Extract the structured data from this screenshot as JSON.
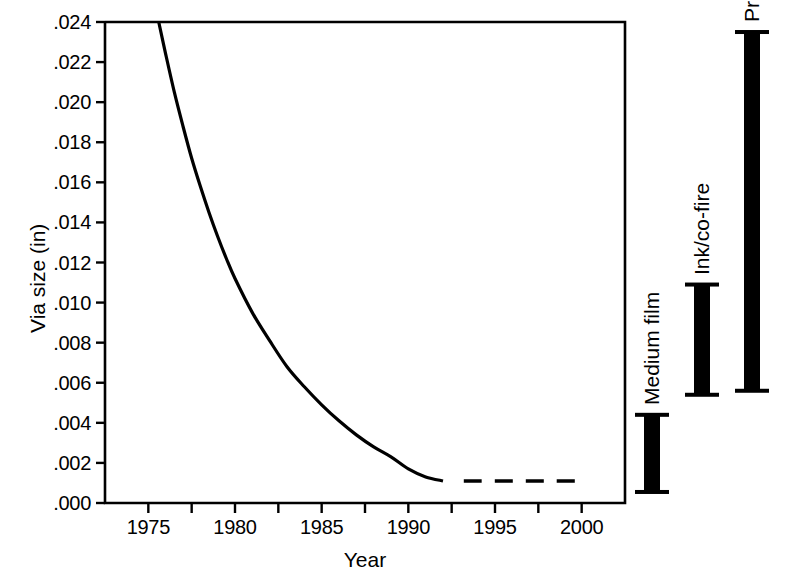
{
  "chart_data": {
    "type": "line",
    "title": "",
    "xlabel": "Year",
    "ylabel": "Via size (in)",
    "xlim": [
      1972.5,
      2002.5
    ],
    "ylim": [
      0.0,
      0.024
    ],
    "grid": false,
    "legend": "none",
    "x_tick_labels": [
      "1975",
      "1980",
      "1985",
      "1990",
      "1995",
      "2000"
    ],
    "x_tick_values": [
      1975,
      1980,
      1985,
      1990,
      1995,
      2000
    ],
    "x_minor_tick_values": [
      1977.5,
      1982.5,
      1987.5,
      1992.5,
      1997.5
    ],
    "y_tick_labels": [
      ".024",
      ".022",
      ".020",
      ".018",
      ".016",
      ".014",
      ".012",
      ".010",
      ".008",
      ".006",
      ".004",
      ".002",
      ".000"
    ],
    "y_tick_values": [
      0.024,
      0.022,
      0.02,
      0.018,
      0.016,
      0.014,
      0.012,
      0.01,
      0.008,
      0.006,
      0.004,
      0.002,
      0.0
    ],
    "series": [
      {
        "name": "via-size-historical",
        "style": "solid",
        "x": [
          1975.6,
          1976.0,
          1976.5,
          1977.0,
          1977.5,
          1978.0,
          1978.5,
          1979.0,
          1979.5,
          1980.0,
          1981.0,
          1982.0,
          1983.0,
          1984.0,
          1985.0,
          1986.0,
          1987.0,
          1988.0,
          1989.0,
          1990.0,
          1991.0,
          1992.0
        ],
        "values": [
          0.024,
          0.0224,
          0.0205,
          0.0188,
          0.0172,
          0.0158,
          0.0145,
          0.0133,
          0.0122,
          0.0112,
          0.0095,
          0.0081,
          0.0068,
          0.0058,
          0.0049,
          0.0041,
          0.0034,
          0.0028,
          0.0023,
          0.0017,
          0.0013,
          0.0011
        ]
      },
      {
        "name": "via-size-projected",
        "style": "dashed",
        "x": [
          1993.2,
          1994.0,
          1995.0,
          1996.0,
          1997.0,
          1998.0,
          1999.0,
          2000.3
        ],
        "values": [
          0.0011,
          0.0011,
          0.0011,
          0.0011,
          0.0011,
          0.0011,
          0.0011,
          0.0011
        ]
      }
    ],
    "range_bars": [
      {
        "name": "medium-film",
        "label": "Medium film",
        "min": 0.00055,
        "max": 0.0044,
        "x_px": 652
      },
      {
        "name": "ink-co-fire",
        "label": "Ink/co-fire",
        "min": 0.0054,
        "max": 0.0109,
        "x_px": 702
      },
      {
        "name": "print-etch",
        "label": "Print/etch",
        "min": 0.0056,
        "max": 0.0235,
        "x_px": 752
      }
    ]
  },
  "colors": {
    "ink": "#000000",
    "background": "#ffffff"
  }
}
